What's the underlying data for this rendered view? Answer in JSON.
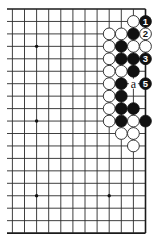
{
  "diagram": {
    "type": "go-board-partial",
    "visible_columns": 12,
    "visible_rows": 19,
    "edges_shown": [
      "top",
      "right",
      "bottom"
    ],
    "grid": {
      "x0": 12.4,
      "dx": 12.1,
      "y0": 9,
      "dy": 12.45,
      "left_stub_x": 7
    },
    "colors": {
      "line": "#2a2a2a",
      "black_stone": "#111111",
      "white_stone": "#ffffff",
      "background": "#ffffff"
    },
    "star_points": [
      {
        "col": 2,
        "row": 3
      },
      {
        "col": 2,
        "row": 9
      },
      {
        "col": 2,
        "row": 15
      },
      {
        "col": 8,
        "row": 15
      }
    ],
    "stones": [
      {
        "col": 10,
        "row": 1,
        "color": "white",
        "label": ""
      },
      {
        "col": 11,
        "row": 1,
        "color": "black",
        "label": "1"
      },
      {
        "col": 8,
        "row": 2,
        "color": "white",
        "label": ""
      },
      {
        "col": 9,
        "row": 2,
        "color": "white",
        "label": ""
      },
      {
        "col": 10,
        "row": 2,
        "color": "black",
        "label": ""
      },
      {
        "col": 11,
        "row": 2,
        "color": "white",
        "label": "2"
      },
      {
        "col": 8,
        "row": 3,
        "color": "white",
        "label": ""
      },
      {
        "col": 9,
        "row": 3,
        "color": "black",
        "label": ""
      },
      {
        "col": 10,
        "row": 3,
        "color": "white",
        "label": ""
      },
      {
        "col": 11,
        "row": 3,
        "color": "white",
        "label": ""
      },
      {
        "col": 8,
        "row": 4,
        "color": "white",
        "label": ""
      },
      {
        "col": 9,
        "row": 4,
        "color": "black",
        "label": ""
      },
      {
        "col": 10,
        "row": 4,
        "color": "black",
        "label": ""
      },
      {
        "col": 11,
        "row": 4,
        "color": "black",
        "label": "3"
      },
      {
        "col": 8,
        "row": 5,
        "color": "white",
        "label": ""
      },
      {
        "col": 9,
        "row": 5,
        "color": "white",
        "label": ""
      },
      {
        "col": 10,
        "row": 5,
        "color": "black",
        "label": ""
      },
      {
        "col": 8,
        "row": 6,
        "color": "white",
        "label": ""
      },
      {
        "col": 9,
        "row": 6,
        "color": "black",
        "label": ""
      },
      {
        "col": 11,
        "row": 6,
        "color": "black",
        "label": "5"
      },
      {
        "col": 8,
        "row": 7,
        "color": "white",
        "label": ""
      },
      {
        "col": 9,
        "row": 7,
        "color": "black",
        "label": ""
      },
      {
        "col": 8,
        "row": 8,
        "color": "white",
        "label": ""
      },
      {
        "col": 9,
        "row": 8,
        "color": "black",
        "label": ""
      },
      {
        "col": 10,
        "row": 8,
        "color": "black",
        "label": ""
      },
      {
        "col": 8,
        "row": 9,
        "color": "white",
        "label": ""
      },
      {
        "col": 9,
        "row": 9,
        "color": "black",
        "label": ""
      },
      {
        "col": 10,
        "row": 9,
        "color": "white",
        "label": ""
      },
      {
        "col": 11,
        "row": 9,
        "color": "black",
        "label": ""
      },
      {
        "col": 9,
        "row": 10,
        "color": "white",
        "label": ""
      },
      {
        "col": 10,
        "row": 10,
        "color": "white",
        "label": ""
      },
      {
        "col": 10,
        "row": 11,
        "color": "white",
        "label": ""
      }
    ],
    "point_labels": [
      {
        "col": 10,
        "row": 6,
        "text": "a"
      }
    ]
  }
}
